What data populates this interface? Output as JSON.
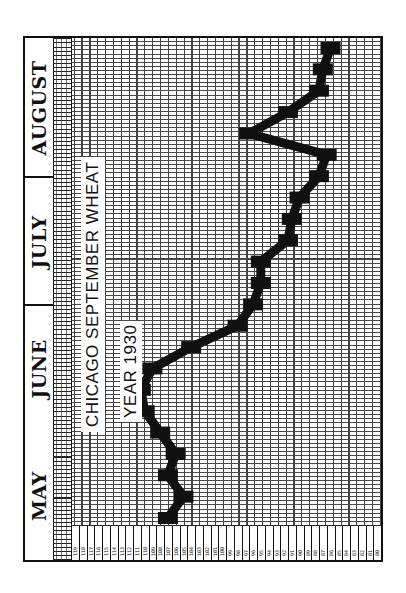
{
  "chart_data": {
    "type": "line",
    "title": "CHICAGO SEPTEMBER WHEAT",
    "subtitle": "YEAR 1930",
    "orientation": "rotated 90deg counter-clockwise (time runs bottom-to-top, price left-to-right)",
    "xlabel": "Date (daily, May–August 1930)",
    "ylabel": "Price (cents per bushel)",
    "months": [
      "MAY",
      "JUNE",
      "JULY",
      "AUGUST"
    ],
    "ylim": [
      80,
      119
    ],
    "price_ticks": [
      119,
      118,
      117,
      116,
      115,
      114,
      113,
      112,
      111,
      110,
      109,
      108,
      107,
      106,
      105,
      104,
      103,
      102,
      101,
      100,
      99,
      98,
      97,
      96,
      95,
      94,
      93,
      92,
      91,
      90,
      89,
      88,
      87,
      86,
      85,
      84,
      83,
      82,
      81,
      80
    ],
    "grid": true,
    "x": [
      "May 1",
      "May 5",
      "May 10",
      "May 15",
      "May 20",
      "May 26",
      "May 31",
      "Jun 4",
      "Jun 8",
      "Jun 12",
      "Jun 17",
      "Jun 23",
      "Jun 30",
      "Jul 5",
      "Jul 12",
      "Jul 18",
      "Jul 24",
      "Jul 31",
      "Aug 5",
      "Aug 10",
      "Aug 15",
      "Aug 20",
      "Aug 27"
    ],
    "values": [
      107,
      105,
      107,
      106,
      108,
      110,
      110.5,
      109,
      104,
      98,
      96,
      95,
      95,
      91.5,
      91,
      90,
      87.5,
      86.5,
      96.5,
      91.5,
      87.5,
      87,
      86
    ]
  },
  "header": {
    "months": [
      {
        "label": "MAY"
      },
      {
        "label": "JUNE"
      },
      {
        "label": "JULY"
      },
      {
        "label": "AUGUST"
      }
    ]
  },
  "annotations": {
    "title": "CHICAGO SEPTEMBER WHEAT",
    "year": "YEAR 1930"
  }
}
